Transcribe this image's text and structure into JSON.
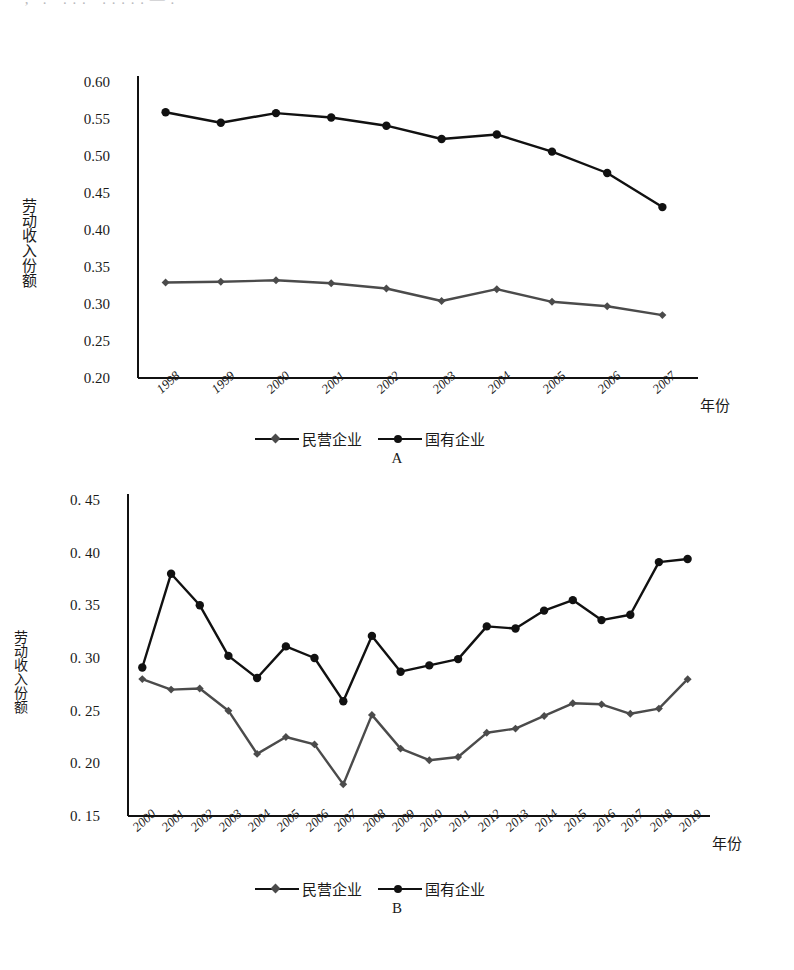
{
  "top_cut_text": "· , ' . · . . . · . . . . . — .",
  "charts": [
    {
      "panel_letter": "A",
      "y_axis_title": "劳动收入份额",
      "x_axis_title": "年份",
      "y_ticks": [
        "0.60",
        "0.55",
        "0.50",
        "0.45",
        "0.40",
        "0.35",
        "0.30",
        "0.25",
        "0.20"
      ],
      "legend": [
        {
          "label": "民营企业",
          "marker": "diamond"
        },
        {
          "label": "国有企业",
          "marker": "circle"
        }
      ]
    },
    {
      "panel_letter": "B",
      "y_axis_title": "劳动收入份额",
      "x_axis_title": "年份",
      "y_ticks": [
        "0. 45",
        "0. 40",
        "0. 35",
        "0. 30",
        "0. 25",
        "0. 20",
        "0. 15"
      ],
      "legend": [
        {
          "label": "民营企业",
          "marker": "diamond"
        },
        {
          "label": "国有企业",
          "marker": "circle"
        }
      ]
    }
  ],
  "chart_data": [
    {
      "type": "line",
      "panel": "A",
      "title": "",
      "xlabel": "年份",
      "ylabel": "劳动收入份额",
      "categories": [
        "1998",
        "1999",
        "2000",
        "2001",
        "2002",
        "2003",
        "2004",
        "2005",
        "2006",
        "2007"
      ],
      "x": [
        1998,
        1999,
        2000,
        2001,
        2002,
        2003,
        2004,
        2005,
        2006,
        2007
      ],
      "ylim": [
        0.2,
        0.6
      ],
      "ytick_values": [
        0.6,
        0.55,
        0.5,
        0.45,
        0.4,
        0.35,
        0.3,
        0.25,
        0.2
      ],
      "grid": false,
      "legend_position": "bottom",
      "series": [
        {
          "name": "民营企业",
          "marker": "diamond",
          "color": "#4b4b4b",
          "values": [
            0.329,
            0.33,
            0.332,
            0.328,
            0.321,
            0.304,
            0.32,
            0.303,
            0.297,
            0.285
          ]
        },
        {
          "name": "国有企业",
          "marker": "circle",
          "color": "#111111",
          "values": [
            0.559,
            0.545,
            0.558,
            0.552,
            0.541,
            0.523,
            0.529,
            0.506,
            0.477,
            0.431
          ]
        }
      ]
    },
    {
      "type": "line",
      "panel": "B",
      "title": "",
      "xlabel": "年份",
      "ylabel": "劳动收入份额",
      "categories": [
        "2000",
        "2001",
        "2002",
        "2003",
        "2004",
        "2005",
        "2006",
        "2007",
        "2008",
        "2009",
        "2010",
        "2011",
        "2012",
        "2013",
        "2014",
        "2015",
        "2016",
        "2017",
        "2018",
        "2019"
      ],
      "x": [
        2000,
        2001,
        2002,
        2003,
        2004,
        2005,
        2006,
        2007,
        2008,
        2009,
        2010,
        2011,
        2012,
        2013,
        2014,
        2015,
        2016,
        2017,
        2018,
        2019
      ],
      "ylim": [
        0.15,
        0.45
      ],
      "ytick_values": [
        0.45,
        0.4,
        0.35,
        0.3,
        0.25,
        0.2,
        0.15
      ],
      "grid": false,
      "legend_position": "bottom",
      "series": [
        {
          "name": "民营企业",
          "marker": "diamond",
          "color": "#4b4b4b",
          "values": [
            0.28,
            0.27,
            0.271,
            0.25,
            0.209,
            0.225,
            0.218,
            0.18,
            0.246,
            0.214,
            0.203,
            0.206,
            0.229,
            0.233,
            0.245,
            0.257,
            0.256,
            0.247,
            0.252,
            0.28
          ]
        },
        {
          "name": "国有企业",
          "marker": "circle",
          "color": "#111111",
          "values": [
            0.291,
            0.38,
            0.35,
            0.302,
            0.281,
            0.311,
            0.3,
            0.259,
            0.321,
            0.287,
            0.293,
            0.299,
            0.33,
            0.328,
            0.345,
            0.355,
            0.336,
            0.341,
            0.391,
            0.394
          ]
        }
      ]
    }
  ]
}
